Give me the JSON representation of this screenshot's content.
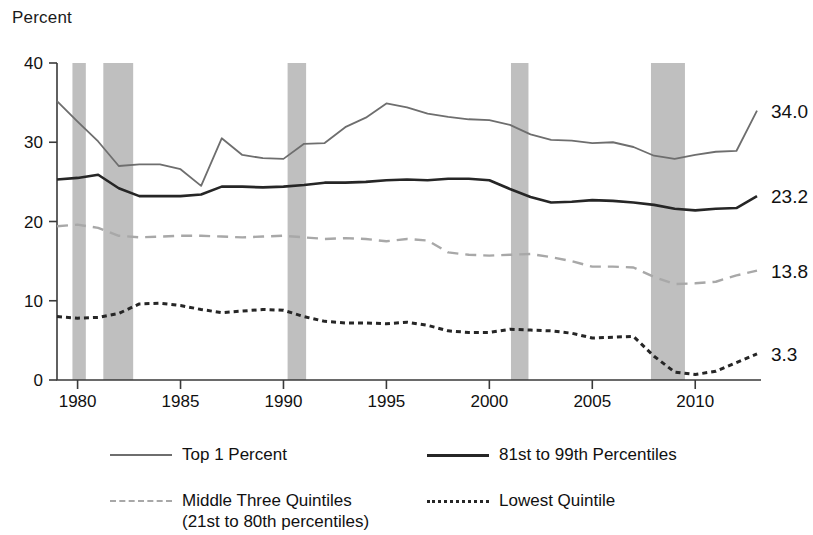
{
  "axis": {
    "ylabel": "Percent",
    "yticks": [
      "0",
      "10",
      "20",
      "30",
      "40"
    ],
    "xticks": [
      "1980",
      "1985",
      "1990",
      "1995",
      "2000",
      "2005",
      "2010"
    ]
  },
  "end_labels": {
    "top1": "34.0",
    "p81_99": "23.2",
    "middle": "13.8",
    "lowest": "3.3"
  },
  "legend": {
    "items": [
      {
        "label": "Top 1 Percent",
        "style": "solid-gray",
        "color": "#6e6e6e"
      },
      {
        "label": "81st to 99th Percentiles",
        "style": "solid-dark",
        "color": "#262626"
      },
      {
        "label": "Middle Three Quintiles",
        "sublabel": "(21st to 80th percentiles)",
        "style": "dashed-light",
        "color": "#a8a8a8"
      },
      {
        "label": "Lowest Quintile",
        "style": "dotted-dark",
        "color": "#262626"
      }
    ]
  },
  "chart_data": {
    "type": "line",
    "title": "",
    "xlabel": "",
    "ylabel": "Percent",
    "xlim": [
      1979,
      2013
    ],
    "ylim": [
      0,
      40
    ],
    "yticks": [
      0,
      10,
      20,
      30,
      40
    ],
    "xticks": [
      1980,
      1985,
      1990,
      1995,
      2000,
      2005,
      2010
    ],
    "grid": false,
    "legend_position": "bottom",
    "x": [
      1979,
      1980,
      1981,
      1982,
      1983,
      1984,
      1985,
      1986,
      1987,
      1988,
      1989,
      1990,
      1991,
      1992,
      1993,
      1994,
      1995,
      1996,
      1997,
      1998,
      1999,
      2000,
      2001,
      2002,
      2003,
      2004,
      2005,
      2006,
      2007,
      2008,
      2009,
      2010,
      2011,
      2012,
      2013
    ],
    "series": [
      {
        "name": "Top 1 Percent",
        "color": "#6e6e6e",
        "style": "solid",
        "end_value": 34.0,
        "values": [
          35.2,
          32.6,
          30.1,
          27.0,
          27.2,
          27.2,
          26.6,
          24.5,
          30.5,
          28.4,
          28.0,
          27.9,
          29.8,
          29.9,
          31.9,
          33.1,
          34.9,
          34.4,
          33.6,
          33.2,
          32.9,
          32.8,
          32.2,
          31.0,
          30.3,
          30.2,
          29.9,
          30.0,
          29.4,
          28.3,
          27.9,
          28.4,
          28.8,
          28.9,
          34.0
        ]
      },
      {
        "name": "81st to 99th Percentiles",
        "color": "#262626",
        "style": "solid",
        "end_value": 23.2,
        "values": [
          25.3,
          25.5,
          25.9,
          24.2,
          23.2,
          23.2,
          23.2,
          23.4,
          24.4,
          24.4,
          24.3,
          24.4,
          24.6,
          24.9,
          24.9,
          25.0,
          25.2,
          25.3,
          25.2,
          25.4,
          25.4,
          25.2,
          24.1,
          23.1,
          22.4,
          22.5,
          22.7,
          22.6,
          22.4,
          22.1,
          21.6,
          21.4,
          21.6,
          21.7,
          23.2
        ]
      },
      {
        "name": "Middle Three Quintiles",
        "sublabel": "(21st to 80th percentiles)",
        "color": "#a8a8a8",
        "style": "dashed",
        "end_value": 13.8,
        "values": [
          19.4,
          19.6,
          19.2,
          18.2,
          18.0,
          18.1,
          18.2,
          18.2,
          18.1,
          18.0,
          18.1,
          18.2,
          18.0,
          17.8,
          17.9,
          17.8,
          17.5,
          17.8,
          17.6,
          16.1,
          15.8,
          15.7,
          15.8,
          15.9,
          15.5,
          15.0,
          14.3,
          14.3,
          14.2,
          13.0,
          12.1,
          12.2,
          12.4,
          13.2,
          13.8
        ]
      },
      {
        "name": "Lowest Quintile",
        "color": "#262626",
        "style": "dotted",
        "end_value": 3.3,
        "values": [
          8.0,
          7.8,
          7.9,
          8.4,
          9.6,
          9.7,
          9.4,
          8.9,
          8.5,
          8.7,
          8.9,
          8.8,
          8.0,
          7.4,
          7.2,
          7.2,
          7.1,
          7.3,
          6.9,
          6.2,
          6.0,
          6.0,
          6.4,
          6.3,
          6.2,
          5.9,
          5.3,
          5.4,
          5.5,
          3.0,
          1.0,
          0.7,
          1.1,
          2.2,
          3.3
        ]
      }
    ],
    "recession_bands": [
      {
        "start": 1979.75,
        "end": 1980.4
      },
      {
        "start": 1981.25,
        "end": 1982.7
      },
      {
        "start": 1990.2,
        "end": 1991.1
      },
      {
        "start": 2001.05,
        "end": 2001.9
      },
      {
        "start": 2007.85,
        "end": 2009.5
      }
    ]
  }
}
